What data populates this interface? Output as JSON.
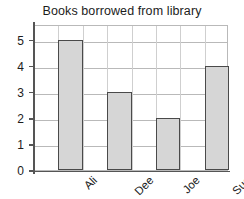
{
  "chart_data": {
    "type": "bar",
    "title": "Books borrowed from library",
    "categories": [
      "Ali",
      "Dee",
      "Joe",
      "Sue"
    ],
    "values": [
      5,
      3,
      2,
      4
    ],
    "xlabel": "",
    "ylabel": "",
    "ylim": [
      0,
      5.6
    ],
    "yticks": [
      0,
      1,
      2,
      3,
      4,
      5
    ],
    "ytick_labels": [
      "0",
      "1",
      "2",
      "3",
      "4",
      "5"
    ],
    "grid": true,
    "grid_axis": "both",
    "legend": false,
    "xtick_label_rotation": -45,
    "colors": {
      "bar_fill": "#d6d6d6",
      "bar_edge": "#4a4a4a",
      "grid": "#b9b9b9",
      "grid_vertical": "#cfcfcf",
      "axis": "#555555",
      "text": "#1c1c1c",
      "background": "#ffffff"
    }
  }
}
